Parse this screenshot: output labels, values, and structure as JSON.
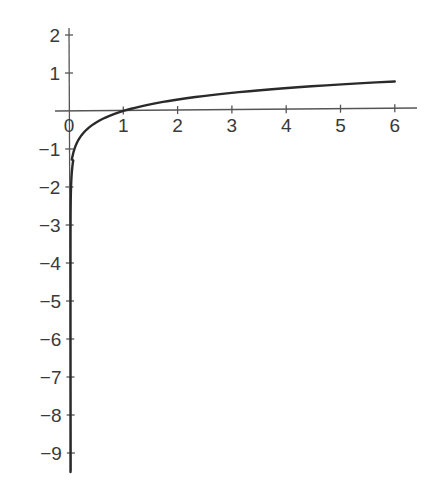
{
  "chart_data": {
    "type": "line",
    "title": "",
    "xlabel": "",
    "ylabel": "",
    "function": "y = log10(x)",
    "xlim": [
      -0.1,
      6.3
    ],
    "ylim": [
      -9.5,
      2.2
    ],
    "grid": false,
    "legend": null,
    "x_ticks": [
      0,
      1,
      2,
      3,
      4,
      5,
      6
    ],
    "x_tick_labels": [
      "0",
      "1",
      "2",
      "3",
      "4",
      "5",
      "6"
    ],
    "y_ticks": [
      2,
      1,
      -1,
      -2,
      -3,
      -4,
      -5,
      -6,
      -7,
      -8,
      -9
    ],
    "y_tick_labels": [
      "2",
      "1",
      "−1",
      "−2",
      "−3",
      "−4",
      "−5",
      "−6",
      "−7",
      "−8",
      "−9"
    ],
    "series": [
      {
        "name": "log curve",
        "color": "#2a2a2a",
        "x": [
          3e-10,
          1e-06,
          0.001,
          0.01,
          0.05,
          0.1,
          0.2,
          0.3,
          0.5,
          0.75,
          1,
          1.5,
          2,
          2.5,
          3,
          3.5,
          4,
          4.5,
          5,
          5.5,
          6
        ],
        "y": [
          -9.5,
          -6,
          -3,
          -2,
          -1.3,
          -1,
          -0.7,
          -0.52,
          -0.3,
          -0.12,
          0,
          0.18,
          0.3,
          0.4,
          0.48,
          0.54,
          0.6,
          0.65,
          0.7,
          0.74,
          0.78
        ]
      }
    ]
  }
}
